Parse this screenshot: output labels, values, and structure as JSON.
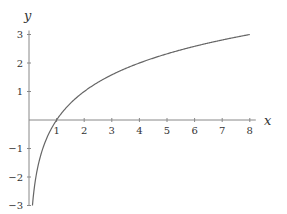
{
  "chart_data": {
    "type": "line",
    "title": "",
    "xlabel": "x",
    "ylabel": "y",
    "function": "y = log2(x)",
    "xlim": [
      0,
      8
    ],
    "ylim": [
      -3,
      3
    ],
    "x_ticks": [
      1,
      2,
      3,
      4,
      5,
      6,
      7,
      8
    ],
    "y_ticks": [
      -3,
      -2,
      -1,
      1,
      2,
      3
    ],
    "x_tick_labels": [
      "1",
      "2",
      "3",
      "4",
      "5",
      "6",
      "7",
      "8"
    ],
    "y_tick_labels": [
      "−3",
      "−2",
      "−1",
      "1",
      "2",
      "3"
    ],
    "grid": false,
    "legend": null,
    "series": [
      {
        "name": "log2(x)",
        "color": "#666666",
        "x": [
          0.125,
          0.25,
          0.5,
          1,
          2,
          3,
          4,
          5,
          6,
          7,
          8
        ],
        "values": [
          -3,
          -2,
          -1,
          0,
          1,
          1.585,
          2,
          2.322,
          2.585,
          2.807,
          3
        ]
      }
    ]
  },
  "colors": {
    "axis": "#888888",
    "curve": "#666666",
    "text": "#333333"
  }
}
